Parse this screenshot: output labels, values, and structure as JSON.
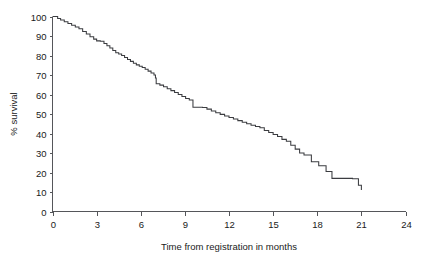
{
  "chart_data": {
    "type": "line",
    "subtype": "kaplan-meier-step",
    "title": "",
    "xlabel": "Time from registration in months",
    "ylabel": "% survival",
    "xlim": [
      0,
      24
    ],
    "ylim": [
      0,
      100
    ],
    "xticks": [
      0,
      3,
      6,
      9,
      12,
      15,
      18,
      21,
      24
    ],
    "xtick_labels": [
      "0",
      "3",
      "6",
      "9",
      "12",
      "15",
      "18",
      "21",
      "24"
    ],
    "yticks": [
      0,
      10,
      20,
      30,
      40,
      50,
      60,
      70,
      80,
      90,
      100
    ],
    "ytick_labels": [
      "0",
      "10",
      "20",
      "30",
      "40",
      "50",
      "60",
      "70",
      "80",
      "90",
      "100"
    ],
    "grid": false,
    "legend": false,
    "legend_position": "none",
    "line_color": "#3b3c40",
    "axis_color": "#55565a",
    "background_color": "#ffffff",
    "series": [
      {
        "name": "survival",
        "step": "post",
        "x": [
          0.0,
          0.35,
          0.55,
          0.8,
          1.05,
          1.3,
          1.55,
          1.8,
          2.05,
          2.3,
          2.55,
          2.8,
          3.0,
          3.25,
          3.5,
          3.7,
          3.9,
          4.1,
          4.3,
          4.5,
          4.7,
          4.9,
          5.1,
          5.3,
          5.5,
          5.7,
          5.9,
          6.1,
          6.3,
          6.5,
          6.7,
          6.9,
          7.0,
          7.05,
          7.3,
          7.55,
          7.8,
          8.05,
          8.3,
          8.55,
          8.8,
          9.05,
          9.3,
          9.55,
          10.2,
          10.5,
          10.8,
          11.1,
          11.4,
          11.7,
          12.0,
          12.3,
          12.6,
          12.9,
          13.2,
          13.5,
          13.8,
          14.1,
          14.4,
          14.7,
          15.0,
          15.3,
          15.6,
          15.9,
          16.2,
          16.5,
          16.8,
          17.1,
          17.6,
          18.1,
          18.6,
          19.0,
          20.4,
          20.8,
          21.0
        ],
        "y": [
          100.0,
          99.0,
          98.2,
          97.3,
          96.4,
          95.5,
          94.6,
          93.7,
          92.3,
          91.0,
          89.6,
          88.4,
          87.5,
          87.3,
          86.2,
          85.0,
          83.8,
          82.6,
          81.4,
          80.8,
          80.0,
          79.0,
          78.0,
          77.0,
          76.0,
          75.2,
          74.5,
          73.8,
          73.0,
          72.0,
          71.0,
          70.0,
          68.5,
          65.5,
          64.8,
          64.0,
          63.0,
          62.0,
          61.0,
          60.0,
          59.0,
          58.0,
          57.2,
          53.5,
          53.3,
          52.5,
          51.5,
          50.6,
          49.8,
          49.0,
          48.2,
          47.4,
          46.6,
          45.8,
          45.0,
          44.2,
          43.6,
          43.0,
          41.5,
          40.5,
          39.5,
          38.5,
          37.0,
          36.0,
          34.0,
          32.0,
          30.0,
          29.0,
          25.5,
          23.5,
          20.5,
          17.0,
          16.8,
          13.5,
          11.0
        ]
      }
    ]
  },
  "axis": {
    "x_title": "Time from registration in months",
    "y_title": "% survival"
  }
}
